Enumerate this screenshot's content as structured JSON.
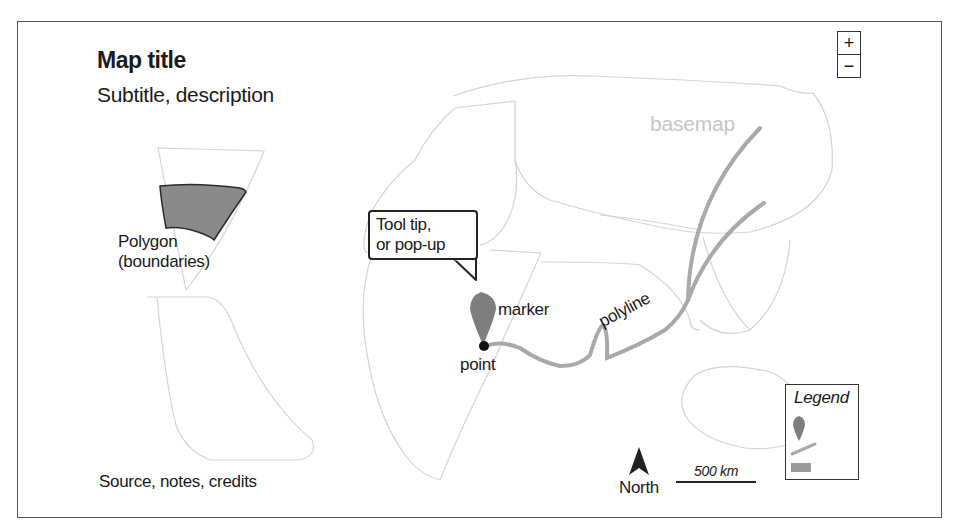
{
  "map": {
    "title": "Map title",
    "subtitle": "Subtitle, description",
    "credits": "Source, notes, credits"
  },
  "zoom_controls": {
    "zoom_in": "+",
    "zoom_out": "−"
  },
  "annotations": {
    "polygon_line1": "Polygon",
    "polygon_line2": "(boundaries)",
    "tooltip_line1": "Tool tip,",
    "tooltip_line2": "or pop-up",
    "marker": "marker",
    "point": "point",
    "polyline": "polyline",
    "basemap": "basemap"
  },
  "north_arrow": {
    "label": "North"
  },
  "scale_bar": {
    "label": "500 km"
  },
  "legend": {
    "title": "Legend",
    "items": [
      {
        "icon": "marker-icon"
      },
      {
        "icon": "line-icon"
      },
      {
        "icon": "polygon-swatch-icon"
      }
    ]
  },
  "colors": {
    "polygon_fill": "#8a8a8a",
    "polyline": "#a9a9a9",
    "marker": "#7e7e7e",
    "basemap_lines": "#d2d2d2",
    "basemap_label": "#c6c6c6",
    "text": "#1a1a1a"
  }
}
